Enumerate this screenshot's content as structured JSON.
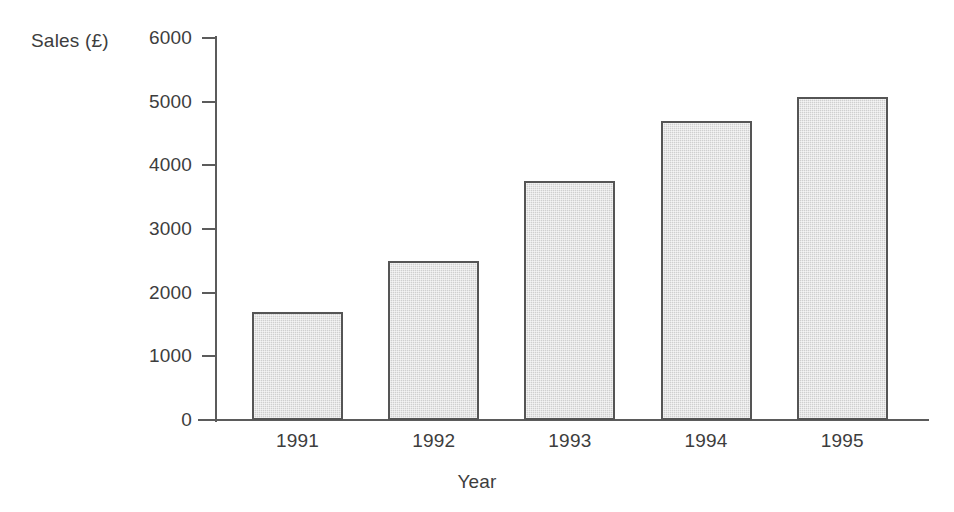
{
  "chart_data": {
    "type": "bar",
    "title": "",
    "categories": [
      "1991",
      "1992",
      "1993",
      "1994",
      "1995"
    ],
    "values": [
      1700,
      2500,
      3750,
      4700,
      5080
    ],
    "series": [
      {
        "name": "Sales",
        "values": [
          1700,
          2500,
          3750,
          4700,
          5080
        ]
      }
    ],
    "xlabel": "Year",
    "ylabel": "Sales (£)",
    "ylim": [
      0,
      6000
    ],
    "yticks": [
      0,
      1000,
      2000,
      3000,
      4000,
      5000,
      6000
    ],
    "ytick_labels": [
      "0",
      "1000",
      "2000",
      "3000",
      "4000",
      "5000",
      "6000"
    ],
    "grid": false,
    "legend": "none",
    "bar_fill_color": "#cfcfcf",
    "bar_border_color": "#555555",
    "axis_color": "#5b5b5b",
    "text_color": "#3d3d3d",
    "background_color": "#ffffff"
  },
  "axes": {
    "y_title": "Sales (£)",
    "x_title": "Year"
  },
  "y_ticks": [
    {
      "label": "6000",
      "value": 6000
    },
    {
      "label": "5000",
      "value": 5000
    },
    {
      "label": "4000",
      "value": 4000
    },
    {
      "label": "3000",
      "value": 3000
    },
    {
      "label": "2000",
      "value": 2000
    },
    {
      "label": "1000",
      "value": 1000
    },
    {
      "label": "0",
      "value": 0
    }
  ],
  "bars": [
    {
      "label": "1991",
      "value": 1700
    },
    {
      "label": "1992",
      "value": 2500
    },
    {
      "label": "1993",
      "value": 3750
    },
    {
      "label": "1994",
      "value": 4700
    },
    {
      "label": "1995",
      "value": 5080
    }
  ]
}
